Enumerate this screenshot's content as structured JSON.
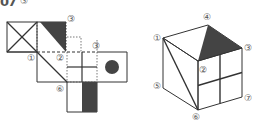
{
  "problem": {
    "number": "07",
    "mark": "③"
  },
  "colors": {
    "line": "#333333",
    "dotted": "#555555",
    "shade": "#444444",
    "label": "#555555"
  },
  "net": {
    "labels": {
      "top_right_of_shaded": "③",
      "flap_label": "③",
      "left_mid": "①",
      "center_mid": "②",
      "bottom": "⑥"
    }
  },
  "cube": {
    "labels": {
      "v1": "①",
      "v2": "②",
      "v3": "③",
      "v4": "④",
      "v5": "⑤",
      "v6": "⑥",
      "v7": "⑦"
    }
  }
}
